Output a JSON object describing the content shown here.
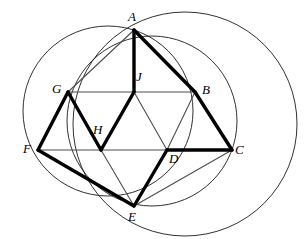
{
  "figure": {
    "width": 307,
    "height": 239,
    "background": "#ffffff",
    "stroke_colors": {
      "circle": "#1a1a1a",
      "thin_edge": "#4d4d4d",
      "thick_edge": "#000000",
      "label": "#000000"
    }
  },
  "points": {
    "A": {
      "label": "A",
      "x": 134,
      "y": 30,
      "label_x": 128,
      "label_y": 10
    },
    "B": {
      "label": "B",
      "x": 195,
      "y": 92,
      "label_x": 202,
      "label_y": 83
    },
    "C": {
      "label": "C",
      "x": 232,
      "y": 150,
      "label_x": 235,
      "label_y": 143
    },
    "D": {
      "label": "D",
      "x": 167,
      "y": 150,
      "label_x": 169,
      "label_y": 152
    },
    "E": {
      "label": "E",
      "x": 134,
      "y": 206,
      "label_x": 128,
      "label_y": 210
    },
    "F": {
      "label": "F",
      "x": 38,
      "y": 150,
      "label_x": 23,
      "label_y": 142
    },
    "G": {
      "label": "G",
      "x": 68,
      "y": 92,
      "label_x": 52,
      "label_y": 82
    },
    "H": {
      "label": "H",
      "x": 101,
      "y": 150,
      "label_x": 93,
      "label_y": 123
    },
    "J": {
      "label": "J",
      "x": 134,
      "y": 92,
      "label_x": 136,
      "label_y": 70
    }
  },
  "circles": [
    {
      "name": "left-circle",
      "cx": 108,
      "cy": 111,
      "r": 85,
      "stroke": "#1a1a1a"
    },
    {
      "name": "middle-circle",
      "cx": 152,
      "cy": 121,
      "r": 85,
      "stroke": "#1a1a1a"
    },
    {
      "name": "right-circle",
      "cx": 185,
      "cy": 124,
      "r": 112,
      "stroke": "#1a1a1a"
    }
  ],
  "thin_edges": [
    {
      "name": "edge-A-G",
      "from": "A",
      "to": "G"
    },
    {
      "name": "edge-G-J",
      "from": "G",
      "to": "J"
    },
    {
      "name": "edge-J-B",
      "from": "J",
      "to": "B"
    },
    {
      "name": "edge-F-H",
      "from": "F",
      "to": "H"
    },
    {
      "name": "edge-H-D",
      "from": "H",
      "to": "D"
    },
    {
      "name": "edge-D-C",
      "from": "D",
      "to": "C"
    },
    {
      "name": "edge-J-D",
      "from": "J",
      "to": "D"
    },
    {
      "name": "edge-B-D",
      "from": "B",
      "to": "D"
    },
    {
      "name": "edge-B-C",
      "from": "B",
      "to": "C"
    },
    {
      "name": "edge-G-H",
      "from": "G",
      "to": "H"
    },
    {
      "name": "edge-H-E",
      "from": "H",
      "to": "E"
    },
    {
      "name": "edge-C-E",
      "from": "C",
      "to": "E"
    },
    {
      "name": "edge-D-E",
      "from": "D",
      "to": "E"
    }
  ],
  "thick_edges": [
    {
      "name": "edge-A-J-thick",
      "from": "A",
      "to": "J"
    },
    {
      "name": "edge-A-B-thick",
      "from": "A",
      "to": "B"
    },
    {
      "name": "edge-B-C-thick",
      "from": "B",
      "to": "C"
    },
    {
      "name": "edge-C-D-thick",
      "from": "C",
      "to": "D"
    },
    {
      "name": "edge-D-E-thick",
      "from": "D",
      "to": "E"
    },
    {
      "name": "edge-E-F-thick",
      "from": "E",
      "to": "F"
    },
    {
      "name": "edge-F-G-thick",
      "from": "F",
      "to": "G"
    },
    {
      "name": "edge-G-H-thick",
      "from": "G",
      "to": "H"
    },
    {
      "name": "edge-H-J-thick",
      "from": "H",
      "to": "J"
    }
  ]
}
